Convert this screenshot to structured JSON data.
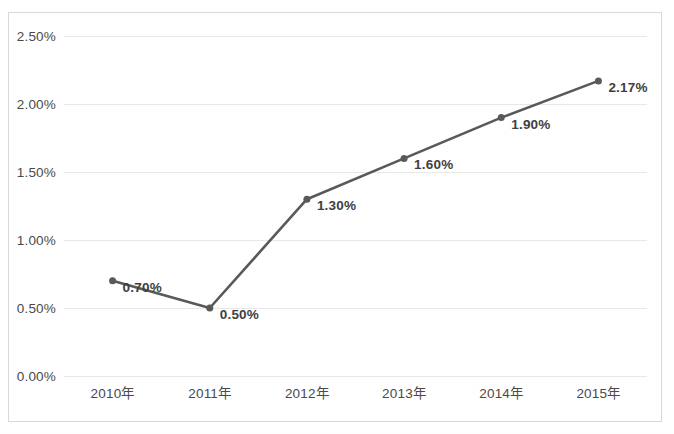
{
  "chart_data": {
    "type": "line",
    "title": "",
    "subtitle": "",
    "xlabel": "",
    "ylabel": "",
    "categories": [
      "2010年",
      "2011年",
      "2012年",
      "2013年",
      "2014年",
      "2015年"
    ],
    "series": [
      {
        "name": "",
        "values": [
          0.7,
          0.5,
          1.3,
          1.6,
          1.9,
          2.17
        ],
        "labels": [
          "0.70%",
          "0.50%",
          "1.30%",
          "1.60%",
          "1.90%",
          "2.17%"
        ],
        "color": "#595959",
        "marker": "circle",
        "line_width": 2.6,
        "marker_size": 7
      }
    ],
    "ylim": [
      0.0,
      2.5
    ],
    "yticks": [
      0.0,
      0.5,
      1.0,
      1.5,
      2.0,
      2.5
    ],
    "ytick_labels": [
      "0.00%",
      "0.50%",
      "1.00%",
      "1.50%",
      "2.00%",
      "2.50%"
    ],
    "grid": true,
    "grid_axis": "y",
    "grid_color": "#e8e8e8",
    "legend": false,
    "legend_position": "none",
    "data_labels": true,
    "plot_border": "#d9d9d9",
    "background": "#ffffff",
    "text_color": "#4a4a4a",
    "label_text_color": "#3f3f3f"
  }
}
